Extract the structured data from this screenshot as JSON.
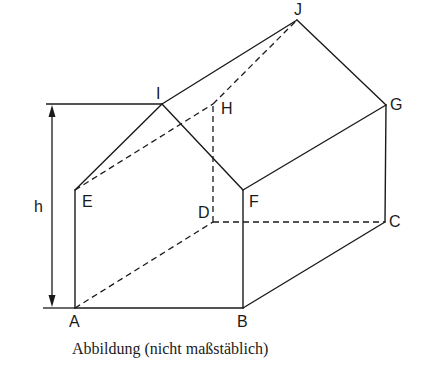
{
  "figure": {
    "caption": "Abbildung (nicht maßstäblich)",
    "colors": {
      "stroke": "#1a1a1a",
      "background": "#ffffff"
    },
    "vertices": {
      "A": {
        "label": "A",
        "x": 75,
        "y": 308
      },
      "B": {
        "label": "B",
        "x": 243,
        "y": 308
      },
      "C": {
        "label": "C",
        "x": 385,
        "y": 222
      },
      "D": {
        "label": "D",
        "x": 213,
        "y": 222
      },
      "E": {
        "label": "E",
        "x": 75,
        "y": 190
      },
      "F": {
        "label": "F",
        "x": 243,
        "y": 190
      },
      "G": {
        "label": "G",
        "x": 386,
        "y": 105
      },
      "H": {
        "label": "H",
        "x": 213,
        "y": 104
      },
      "I": {
        "label": "I",
        "x": 162,
        "y": 104
      },
      "J": {
        "label": "J",
        "x": 297,
        "y": 20
      }
    },
    "solid_edges": [
      "AB",
      "BC",
      "CG",
      "GJ",
      "JI",
      "IE",
      "EA",
      "BF",
      "FI",
      "FG"
    ],
    "dashed_edges": [
      "AD",
      "DC",
      "DH",
      "HJ",
      "EH"
    ],
    "dimension": {
      "label": "h",
      "from": "ground",
      "to": "ridge I"
    }
  }
}
